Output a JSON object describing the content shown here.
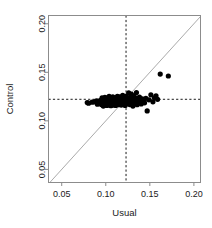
{
  "chart_data": {
    "type": "scatter",
    "title": "",
    "xlabel": "Usual",
    "ylabel": "Control",
    "xlim": [
      0.035,
      0.2075
    ],
    "ylim": [
      0.0365,
      0.2085
    ],
    "xticks": [
      0.05,
      0.1,
      0.15,
      0.2
    ],
    "yticks": [
      0.05,
      0.1,
      0.15,
      0.2
    ],
    "xticklabels": [
      "0.05",
      "0.10",
      "0.15",
      "0.20"
    ],
    "yticklabels": [
      "0.05",
      "0.10",
      "0.15",
      "0.20"
    ],
    "grid": false,
    "legend": null,
    "marker": "filled-circle",
    "marker_color": "#000000",
    "marker_size": 2.6,
    "reference_lines": [
      {
        "name": "identity-line",
        "type": "diagonal",
        "equation": "y = x",
        "color": "#a0a0a0",
        "style": "solid"
      },
      {
        "name": "usual-mean-line",
        "type": "vertical",
        "value": 0.123,
        "color": "#1a1a1a",
        "style": "dashed"
      },
      {
        "name": "control-mean-line",
        "type": "horizontal",
        "value": 0.1222,
        "color": "#1a1a1a",
        "style": "dashed"
      }
    ],
    "n_points": 112,
    "x": [
      0.079,
      0.0805,
      0.0845,
      0.087,
      0.0895,
      0.0905,
      0.093,
      0.094,
      0.095,
      0.0958,
      0.0965,
      0.0972,
      0.098,
      0.0985,
      0.099,
      0.0995,
      0.1,
      0.1005,
      0.1008,
      0.1012,
      0.1018,
      0.1022,
      0.1026,
      0.103,
      0.1034,
      0.1038,
      0.1042,
      0.1046,
      0.105,
      0.1054,
      0.1058,
      0.1062,
      0.1066,
      0.107,
      0.1074,
      0.1078,
      0.108,
      0.1084,
      0.1088,
      0.1092,
      0.1096,
      0.11,
      0.1104,
      0.1108,
      0.1112,
      0.1116,
      0.112,
      0.1124,
      0.1128,
      0.1132,
      0.1136,
      0.114,
      0.1144,
      0.1148,
      0.1152,
      0.1156,
      0.116,
      0.1164,
      0.1168,
      0.1172,
      0.1176,
      0.118,
      0.1184,
      0.1188,
      0.1192,
      0.1196,
      0.12,
      0.1204,
      0.1208,
      0.1212,
      0.1216,
      0.122,
      0.1224,
      0.1228,
      0.1232,
      0.1236,
      0.1242,
      0.1248,
      0.1254,
      0.126,
      0.1266,
      0.1272,
      0.1278,
      0.1284,
      0.129,
      0.1296,
      0.1302,
      0.1308,
      0.1316,
      0.1324,
      0.1332,
      0.134,
      0.1348,
      0.1356,
      0.1364,
      0.1372,
      0.1382,
      0.1392,
      0.1402,
      0.1414,
      0.1426,
      0.144,
      0.1455,
      0.147,
      0.149,
      0.1512,
      0.1535,
      0.1552,
      0.157,
      0.1588,
      0.1618,
      0.171
    ],
    "y": [
      0.1188,
      0.1182,
      0.1192,
      0.1196,
      0.1205,
      0.1172,
      0.1188,
      0.1212,
      0.1168,
      0.1238,
      0.1196,
      0.1152,
      0.1218,
      0.1178,
      0.1242,
      0.1162,
      0.1204,
      0.1186,
      0.1228,
      0.1158,
      0.1198,
      0.1236,
      0.1172,
      0.1214,
      0.1182,
      0.1252,
      0.1164,
      0.1206,
      0.119,
      0.1232,
      0.1156,
      0.1198,
      0.1222,
      0.1176,
      0.1208,
      0.1188,
      0.1246,
      0.1162,
      0.1214,
      0.1192,
      0.1172,
      0.1228,
      0.1186,
      0.1204,
      0.1158,
      0.1238,
      0.1196,
      0.1216,
      0.1174,
      0.1252,
      0.1192,
      0.1208,
      0.1166,
      0.123,
      0.1186,
      0.1204,
      0.1248,
      0.1172,
      0.1218,
      0.1194,
      0.1162,
      0.1234,
      0.1206,
      0.1182,
      0.1262,
      0.1198,
      0.1216,
      0.1174,
      0.124,
      0.1192,
      0.1208,
      0.1158,
      0.1226,
      0.1186,
      0.1254,
      0.1202,
      0.1178,
      0.1232,
      0.1196,
      0.1288,
      0.1214,
      0.1168,
      0.1242,
      0.1198,
      0.1276,
      0.1184,
      0.1222,
      0.1152,
      0.1258,
      0.1204,
      0.1182,
      0.1236,
      0.1292,
      0.1166,
      0.1212,
      0.1188,
      0.1244,
      0.1198,
      0.1174,
      0.1226,
      0.1204,
      0.1186,
      0.1232,
      0.1102,
      0.1216,
      0.1268,
      0.1196,
      0.1238,
      0.1258,
      0.1222,
      0.1482,
      0.1462
    ]
  }
}
